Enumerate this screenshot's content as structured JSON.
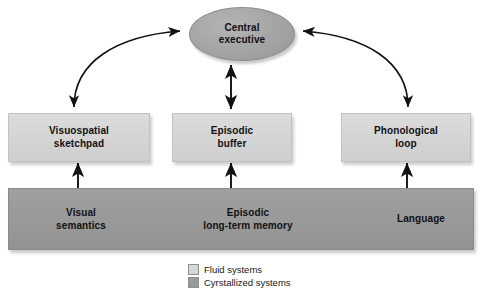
{
  "diagram": {
    "central": {
      "label": "Central\nexecutive",
      "shape": "ellipse",
      "color": "#a6a6a6",
      "system": "crystallized"
    },
    "fluid_boxes": [
      {
        "id": "visuospatial-sketchpad",
        "label": "Visuospatial\nsketchpad"
      },
      {
        "id": "episodic-buffer",
        "label": "Episodic\nbuffer"
      },
      {
        "id": "phonological-loop",
        "label": "Phonological\nloop"
      }
    ],
    "crystallized_bar": {
      "color": "#9a9a9a",
      "items": [
        {
          "id": "visual-semantics",
          "label": "Visual\nsemantics"
        },
        {
          "id": "episodic-long-term-memory",
          "label": "Episodic\nlong-term memory"
        },
        {
          "id": "language",
          "label": "Language"
        }
      ]
    },
    "legend": [
      {
        "id": "fluid-systems",
        "label": "Fluid systems",
        "color": "#d6d6d6"
      },
      {
        "id": "crystallized-systems",
        "label": "Cyrstallized systems",
        "color": "#9a9a9a"
      }
    ],
    "connections": [
      {
        "from": "visuospatial-sketchpad",
        "to": "central-executive",
        "style": "curved",
        "heads": "both"
      },
      {
        "from": "episodic-buffer",
        "to": "central-executive",
        "style": "straight-vertical",
        "heads": "both"
      },
      {
        "from": "phonological-loop",
        "to": "central-executive",
        "style": "curved",
        "heads": "both"
      },
      {
        "from": "visuospatial-sketchpad",
        "to": "visual-semantics",
        "style": "straight-vertical",
        "heads": "both"
      },
      {
        "from": "episodic-buffer",
        "to": "episodic-long-term-memory",
        "style": "straight-vertical",
        "heads": "both"
      },
      {
        "from": "phonological-loop",
        "to": "language",
        "style": "straight-vertical",
        "heads": "both"
      },
      {
        "from": "visual-semantics",
        "to": "episodic-long-term-memory",
        "style": "straight-horizontal",
        "heads": "both"
      },
      {
        "from": "episodic-long-term-memory",
        "to": "language",
        "style": "straight-horizontal",
        "heads": "both"
      }
    ],
    "colors": {
      "fluid": "#d6d6d6",
      "crystallized": "#9a9a9a",
      "central": "#a6a6a6",
      "arrow": "#111111",
      "background": "#ffffff"
    }
  }
}
